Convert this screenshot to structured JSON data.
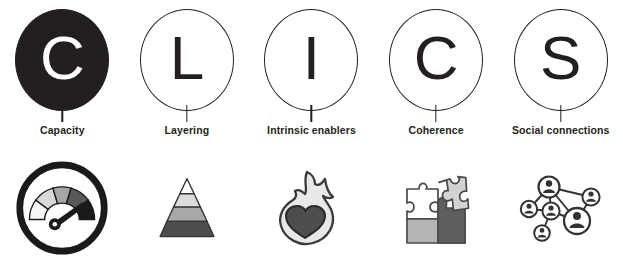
{
  "acronym": "CLICS",
  "palette": {
    "ink": "#231f20",
    "white": "#ffffff",
    "gauge_seg_1": "#f2f2f2",
    "gauge_seg_2": "#d9d9d9",
    "gauge_seg_3": "#a6a6a6",
    "gauge_seg_4": "#595959",
    "gauge_seg_5": "#1a1a1a",
    "pyramid_tier_1": "#ffffff",
    "pyramid_tier_2": "#d9d9d9",
    "pyramid_tier_3": "#a6a6a6",
    "pyramid_tier_4": "#4d4d4d",
    "flame_body": "#e6e6e6",
    "heart": "#4d4d4d",
    "puzzle_light": "#d9d9d9",
    "puzzle_mid": "#a6a6a6",
    "puzzle_dark": "#595959",
    "network_node": "#333333"
  },
  "columns": [
    {
      "letter": "C",
      "label": "Capacity",
      "filled": true,
      "icon": "gauge-icon"
    },
    {
      "letter": "L",
      "label": "Layering",
      "filled": false,
      "icon": "pyramid-icon"
    },
    {
      "letter": "I",
      "label": "Intrinsic enablers",
      "filled": false,
      "icon": "flame-heart-icon"
    },
    {
      "letter": "C",
      "label": "Coherence",
      "filled": false,
      "icon": "puzzle-pieces-icon"
    },
    {
      "letter": "S",
      "label": "Social connections",
      "filled": false,
      "icon": "social-network-icon"
    }
  ]
}
